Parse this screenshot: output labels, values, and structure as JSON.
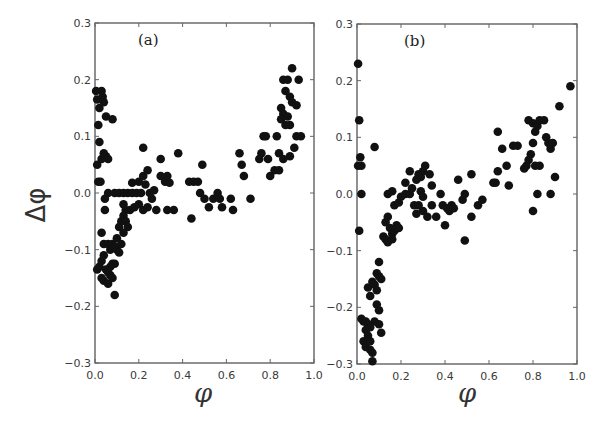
{
  "figure": {
    "ylabel": "Δφ",
    "xlabel": "φ"
  },
  "chart_data": [
    {
      "type": "scatter",
      "panel_label": "(a)",
      "xlabel": "φ",
      "ylabel": "Δφ",
      "xlim": [
        0.0,
        1.0
      ],
      "ylim": [
        -0.3,
        0.3
      ],
      "xticks": [
        "0.0",
        "0.2",
        "0.4",
        "0.6",
        "0.8",
        "1.0"
      ],
      "yticks": [
        "0.3",
        "0.2",
        "0.1",
        "0.0",
        "−0.1",
        "−0.2",
        "−0.3"
      ],
      "grid": false,
      "marker_color": "#111111",
      "points": [
        [
          0.005,
          0.18
        ],
        [
          0.01,
          0.165
        ],
        [
          0.02,
          0.15
        ],
        [
          0.03,
          0.18
        ],
        [
          0.035,
          0.17
        ],
        [
          0.04,
          0.16
        ],
        [
          0.05,
          0.135
        ],
        [
          0.08,
          0.13
        ],
        [
          0.015,
          0.12
        ],
        [
          0.02,
          0.09
        ],
        [
          0.01,
          0.05
        ],
        [
          0.03,
          0.06
        ],
        [
          0.04,
          0.07
        ],
        [
          0.05,
          0.065
        ],
        [
          0.06,
          0.06
        ],
        [
          0.015,
          0.02
        ],
        [
          0.025,
          0.02
        ],
        [
          0.06,
          0.0
        ],
        [
          0.045,
          -0.01
        ],
        [
          0.045,
          -0.03
        ],
        [
          0.09,
          0.0
        ],
        [
          0.11,
          0.0
        ],
        [
          0.13,
          0.0
        ],
        [
          0.15,
          0.0
        ],
        [
          0.17,
          0.0
        ],
        [
          0.19,
          0.0
        ],
        [
          0.21,
          0.0
        ],
        [
          0.13,
          -0.02
        ],
        [
          0.14,
          -0.03
        ],
        [
          0.16,
          -0.03
        ],
        [
          0.18,
          -0.025
        ],
        [
          0.2,
          -0.02
        ],
        [
          0.22,
          -0.03
        ],
        [
          0.24,
          -0.025
        ],
        [
          0.17,
          0.018
        ],
        [
          0.2,
          0.02
        ],
        [
          0.22,
          0.03
        ],
        [
          0.24,
          0.04
        ],
        [
          0.23,
          0.015
        ],
        [
          0.25,
          0.0
        ],
        [
          0.26,
          -0.01
        ],
        [
          0.27,
          0.005
        ],
        [
          0.28,
          -0.03
        ],
        [
          0.22,
          0.08
        ],
        [
          0.3,
          0.06
        ],
        [
          0.3,
          0.03
        ],
        [
          0.32,
          0.02
        ],
        [
          0.33,
          0.03
        ],
        [
          0.34,
          0.018
        ],
        [
          0.33,
          -0.03
        ],
        [
          0.36,
          -0.03
        ],
        [
          0.38,
          0.07
        ],
        [
          0.44,
          -0.045
        ],
        [
          0.43,
          0.02
        ],
        [
          0.45,
          0.02
        ],
        [
          0.47,
          0.02
        ],
        [
          0.49,
          0.05
        ],
        [
          0.48,
          0.0
        ],
        [
          0.5,
          -0.01
        ],
        [
          0.52,
          -0.025
        ],
        [
          0.54,
          -0.01
        ],
        [
          0.56,
          0.0
        ],
        [
          0.57,
          -0.01
        ],
        [
          0.58,
          -0.025
        ],
        [
          0.62,
          -0.01
        ],
        [
          0.63,
          -0.03
        ],
        [
          0.66,
          0.07
        ],
        [
          0.67,
          0.05
        ],
        [
          0.68,
          0.03
        ],
        [
          0.71,
          -0.01
        ],
        [
          0.75,
          0.06
        ],
        [
          0.76,
          0.07
        ],
        [
          0.77,
          0.1
        ],
        [
          0.78,
          0.1
        ],
        [
          0.79,
          0.06
        ],
        [
          0.8,
          0.03
        ],
        [
          0.82,
          0.04
        ],
        [
          0.84,
          0.04
        ],
        [
          0.84,
          0.07
        ],
        [
          0.83,
          0.1
        ],
        [
          0.85,
          0.15
        ],
        [
          0.86,
          0.14
        ],
        [
          0.85,
          0.13
        ],
        [
          0.87,
          0.12
        ],
        [
          0.88,
          0.135
        ],
        [
          0.89,
          0.12
        ],
        [
          0.86,
          0.2
        ],
        [
          0.88,
          0.2
        ],
        [
          0.87,
          0.18
        ],
        [
          0.89,
          0.17
        ],
        [
          0.9,
          0.16
        ],
        [
          0.92,
          0.155
        ],
        [
          0.9,
          0.22
        ],
        [
          0.93,
          0.2
        ],
        [
          0.89,
          0.065
        ],
        [
          0.91,
          0.08
        ],
        [
          0.92,
          0.1
        ],
        [
          0.94,
          0.1
        ],
        [
          0.86,
          0.06
        ],
        [
          0.03,
          -0.07
        ],
        [
          0.04,
          -0.09
        ],
        [
          0.06,
          -0.09
        ],
        [
          0.07,
          -0.1
        ],
        [
          0.08,
          -0.09
        ],
        [
          0.09,
          -0.095
        ],
        [
          0.1,
          -0.08
        ],
        [
          0.11,
          -0.06
        ],
        [
          0.12,
          -0.05
        ],
        [
          0.13,
          -0.04
        ],
        [
          0.14,
          -0.05
        ],
        [
          0.15,
          -0.06
        ],
        [
          0.01,
          -0.135
        ],
        [
          0.02,
          -0.13
        ],
        [
          0.03,
          -0.12
        ],
        [
          0.04,
          -0.11
        ],
        [
          0.05,
          -0.135
        ],
        [
          0.06,
          -0.14
        ],
        [
          0.07,
          -0.13
        ],
        [
          0.08,
          -0.125
        ],
        [
          0.09,
          -0.125
        ],
        [
          0.03,
          -0.15
        ],
        [
          0.04,
          -0.155
        ],
        [
          0.06,
          -0.16
        ],
        [
          0.07,
          -0.145
        ],
        [
          0.08,
          -0.15
        ],
        [
          0.1,
          -0.1
        ],
        [
          0.11,
          -0.105
        ],
        [
          0.12,
          -0.09
        ],
        [
          0.13,
          -0.07
        ],
        [
          0.09,
          -0.18
        ]
      ]
    },
    {
      "type": "scatter",
      "panel_label": "(b)",
      "xlabel": "φ",
      "ylabel": "",
      "xlim": [
        0.0,
        1.0
      ],
      "ylim": [
        -0.3,
        0.3
      ],
      "xticks": [
        "0.0",
        "0.2",
        "0.4",
        "0.6",
        "0.8",
        "1.0"
      ],
      "yticks": [
        "0.3",
        "0.2",
        "0.1",
        "0.0",
        "−0.1",
        "−0.2",
        "−0.3"
      ],
      "grid": false,
      "marker_color": "#111111",
      "points": [
        [
          0.005,
          0.23
        ],
        [
          0.01,
          0.13
        ],
        [
          0.005,
          0.05
        ],
        [
          0.015,
          0.065
        ],
        [
          0.02,
          0.05
        ],
        [
          0.02,
          0.0
        ],
        [
          0.08,
          0.083
        ],
        [
          0.01,
          -0.065
        ],
        [
          0.14,
          0.0
        ],
        [
          0.16,
          0.005
        ],
        [
          0.17,
          -0.02
        ],
        [
          0.19,
          -0.015
        ],
        [
          0.2,
          -0.005
        ],
        [
          0.22,
          0.0
        ],
        [
          0.22,
          0.02
        ],
        [
          0.24,
          0.0
        ],
        [
          0.25,
          0.01
        ],
        [
          0.24,
          0.04
        ],
        [
          0.27,
          0.025
        ],
        [
          0.28,
          0.035
        ],
        [
          0.29,
          0.03
        ],
        [
          0.3,
          0.04
        ],
        [
          0.31,
          0.05
        ],
        [
          0.29,
          0.005
        ],
        [
          0.3,
          -0.005
        ],
        [
          0.33,
          0.035
        ],
        [
          0.34,
          0.015
        ],
        [
          0.26,
          -0.02
        ],
        [
          0.27,
          -0.035
        ],
        [
          0.28,
          -0.02
        ],
        [
          0.3,
          -0.03
        ],
        [
          0.32,
          -0.04
        ],
        [
          0.34,
          -0.02
        ],
        [
          0.36,
          -0.04
        ],
        [
          0.38,
          0.0
        ],
        [
          0.39,
          -0.02
        ],
        [
          0.41,
          -0.025
        ],
        [
          0.42,
          -0.03
        ],
        [
          0.43,
          -0.02
        ],
        [
          0.44,
          -0.025
        ],
        [
          0.46,
          0.025
        ],
        [
          0.48,
          -0.01
        ],
        [
          0.49,
          0.0
        ],
        [
          0.52,
          0.035
        ],
        [
          0.4,
          -0.055
        ],
        [
          0.49,
          -0.082
        ],
        [
          0.52,
          -0.04
        ],
        [
          0.55,
          -0.02
        ],
        [
          0.57,
          -0.01
        ],
        [
          0.62,
          0.02
        ],
        [
          0.63,
          0.02
        ],
        [
          0.64,
          0.04
        ],
        [
          0.68,
          0.05
        ],
        [
          0.69,
          0.015
        ],
        [
          0.66,
          0.08
        ],
        [
          0.64,
          0.11
        ],
        [
          0.71,
          0.085
        ],
        [
          0.73,
          0.085
        ],
        [
          0.76,
          0.045
        ],
        [
          0.77,
          0.05
        ],
        [
          0.78,
          0.06
        ],
        [
          0.79,
          0.07
        ],
        [
          0.8,
          0.09
        ],
        [
          0.81,
          0.05
        ],
        [
          0.83,
          0.05
        ],
        [
          0.78,
          0.13
        ],
        [
          0.8,
          0.125
        ],
        [
          0.81,
          0.11
        ],
        [
          0.82,
          0.12
        ],
        [
          0.83,
          0.13
        ],
        [
          0.85,
          0.13
        ],
        [
          0.86,
          0.1
        ],
        [
          0.87,
          0.09
        ],
        [
          0.88,
          0.08
        ],
        [
          0.89,
          0.09
        ],
        [
          0.82,
          0.0
        ],
        [
          0.88,
          0.0
        ],
        [
          0.9,
          0.03
        ],
        [
          0.92,
          0.155
        ],
        [
          0.97,
          0.19
        ],
        [
          0.8,
          -0.03
        ],
        [
          0.13,
          -0.05
        ],
        [
          0.14,
          -0.04
        ],
        [
          0.15,
          -0.06
        ],
        [
          0.16,
          -0.07
        ],
        [
          0.17,
          -0.065
        ],
        [
          0.18,
          -0.055
        ],
        [
          0.19,
          -0.06
        ],
        [
          0.12,
          -0.075
        ],
        [
          0.13,
          -0.08
        ],
        [
          0.14,
          -0.085
        ],
        [
          0.16,
          -0.08
        ],
        [
          0.1,
          -0.12
        ],
        [
          0.09,
          -0.14
        ],
        [
          0.1,
          -0.145
        ],
        [
          0.11,
          -0.15
        ],
        [
          0.07,
          -0.155
        ],
        [
          0.08,
          -0.16
        ],
        [
          0.05,
          -0.165
        ],
        [
          0.09,
          -0.17
        ],
        [
          0.06,
          -0.18
        ],
        [
          0.09,
          -0.195
        ],
        [
          0.1,
          -0.205
        ],
        [
          0.1,
          -0.23
        ],
        [
          0.11,
          -0.245
        ],
        [
          0.08,
          -0.225
        ],
        [
          0.02,
          -0.22
        ],
        [
          0.03,
          -0.225
        ],
        [
          0.04,
          -0.225
        ],
        [
          0.05,
          -0.23
        ],
        [
          0.06,
          -0.235
        ],
        [
          0.04,
          -0.24
        ],
        [
          0.05,
          -0.25
        ],
        [
          0.03,
          -0.26
        ],
        [
          0.06,
          -0.26
        ],
        [
          0.04,
          -0.27
        ],
        [
          0.06,
          -0.275
        ],
        [
          0.07,
          -0.28
        ],
        [
          0.07,
          -0.295
        ]
      ]
    }
  ]
}
